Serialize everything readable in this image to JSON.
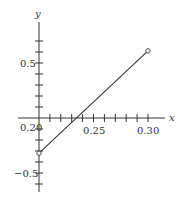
{
  "chart_data": {
    "type": "line",
    "title": "",
    "xlabel": "x",
    "ylabel": "y",
    "xlim": [
      0.2,
      0.315
    ],
    "ylim": [
      -0.7,
      0.85
    ],
    "grid": false,
    "legend": null,
    "x_ticks": [
      0.2,
      0.21,
      0.22,
      0.23,
      0.24,
      0.25,
      0.26,
      0.27,
      0.28,
      0.29,
      0.3
    ],
    "x_tick_labels": [
      "0.20",
      "0.25",
      "0.30"
    ],
    "y_ticks": [
      -0.6,
      -0.5,
      -0.4,
      -0.3,
      -0.2,
      -0.1,
      0.1,
      0.2,
      0.3,
      0.4,
      0.5,
      0.6,
      0.7
    ],
    "y_tick_labels": [
      "0.5",
      "-0.5"
    ],
    "series": [
      {
        "name": "segment",
        "x": [
          0.2,
          0.3
        ],
        "y": [
          -0.32,
          0.61
        ],
        "endpoint_markers": "open-circle"
      }
    ],
    "annotations": []
  },
  "labels": {
    "x_axis": "x",
    "y_axis": "y",
    "x_tick_020": "0.20",
    "x_tick_025": "0.25",
    "x_tick_030": "0.30",
    "y_tick_pos": "0.5",
    "y_tick_neg": "−0.5"
  }
}
